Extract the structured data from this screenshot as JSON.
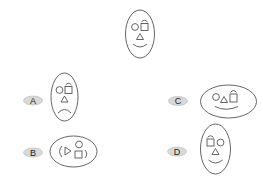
{
  "colors": {
    "stroke": "#555555",
    "pill_fill": "#d9d9d9",
    "pill_stroke": "#b5b5b5",
    "background": "#ffffff"
  },
  "question_figure": {
    "description": "oval face: circle left, square with arc right, triangle nose, smile"
  },
  "options": [
    {
      "label": "A",
      "description": "vertical oval: circle left, square with arc right, triangle, frown"
    },
    {
      "label": "B",
      "description": "horizontal oval rotated: triangle, circle, square, side arcs"
    },
    {
      "label": "C",
      "description": "horizontal oval: circle, triangle, square with arc, smile"
    },
    {
      "label": "D",
      "description": "vertical oval: square with arc left, circle right, triangle, smile"
    }
  ]
}
